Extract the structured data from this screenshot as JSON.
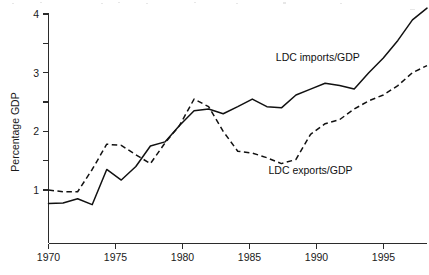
{
  "chart_data": {
    "type": "line",
    "title": "",
    "xlabel": "",
    "ylabel": "Percentage GDP",
    "xlim": [
      1970,
      1996
    ],
    "ylim": [
      0.4,
      4.15
    ],
    "grid": false,
    "legend_position": "inline-annotations",
    "x_ticks": [
      1970,
      1975,
      1980,
      1985,
      1990,
      1995
    ],
    "x_tick_labels": [
      "1970",
      "1975",
      "1980",
      "1985",
      "1990",
      "1995"
    ],
    "y_ticks": [
      1,
      1.5,
      2,
      2.5,
      3,
      3.5,
      4
    ],
    "y_tick_labels": [
      "1",
      "",
      "2",
      "",
      "3",
      "",
      "4"
    ],
    "y_major_labels": [
      "1",
      "2",
      "3",
      "4"
    ],
    "x": [
      1970,
      1971,
      1972,
      1973,
      1974,
      1975,
      1976,
      1977,
      1978,
      1979,
      1980,
      1981,
      1982,
      1983,
      1984,
      1985,
      1986,
      1987,
      1988,
      1989,
      1990,
      1991,
      1992,
      1993,
      1994,
      1995,
      1996
    ],
    "series": [
      {
        "name": "LDC imports/GDP",
        "style": "solid",
        "color": "#111111",
        "values": [
          0.77,
          0.78,
          0.85,
          0.75,
          1.35,
          1.17,
          1.4,
          1.75,
          1.82,
          2.1,
          2.35,
          2.38,
          2.3,
          2.42,
          2.55,
          2.42,
          2.4,
          2.62,
          2.72,
          2.82,
          2.78,
          2.72,
          3.0,
          3.25,
          3.55,
          3.9,
          4.1
        ],
        "annotation": {
          "text": "LDC imports/GDP",
          "x": 1988.5,
          "y": 3.2
        }
      },
      {
        "name": "LDC exports/GDP",
        "style": "dashed",
        "color": "#111111",
        "values": [
          1.0,
          0.97,
          0.97,
          1.35,
          1.78,
          1.76,
          1.6,
          1.45,
          1.8,
          2.1,
          2.55,
          2.42,
          2.0,
          1.66,
          1.63,
          1.55,
          1.45,
          1.52,
          1.95,
          2.13,
          2.2,
          2.38,
          2.52,
          2.62,
          2.78,
          3.0,
          3.12
        ],
        "annotation": {
          "text": "LDC exports/GDP",
          "x": 1988.0,
          "y": 1.28
        }
      }
    ]
  },
  "annotations": {
    "imports_label": "LDC imports/GDP",
    "exports_label": "LDC exports/GDP"
  },
  "axes": {
    "y_title": "Percentage GDP"
  }
}
